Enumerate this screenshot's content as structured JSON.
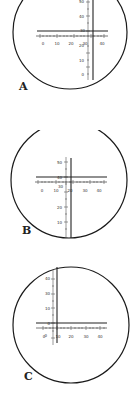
{
  "figure": {
    "panels": [
      {
        "label": "A",
        "top": -8,
        "circle": {
          "cx": 70,
          "cy": 36,
          "r": 56
        },
        "h_scale": {
          "y": 40,
          "x0": 36,
          "x1": 107,
          "ticks": [
            "0",
            "10",
            "20",
            "30",
            "40"
          ],
          "tick_y": 44,
          "label_y": 52
        },
        "v_scale": {
          "x": 88,
          "y0": 5,
          "y1": 86,
          "ticks": [
            "50",
            "40",
            "30",
            "20",
            "10"
          ]
        },
        "crosshair": {
          "h_y": 39,
          "h_x0": 37,
          "h_x1": 108,
          "v_x": 93,
          "v_y0": 0,
          "v_y1": 80
        }
      },
      {
        "label": "B",
        "top": 130,
        "circle": {
          "cx": 70,
          "cy": 57,
          "r": 57
        },
        "h_scale": {
          "y": 52,
          "x0": 36,
          "x1": 107,
          "ticks": [
            "0",
            "10",
            "20",
            "30",
            "40"
          ],
          "tick_y": 56,
          "label_y": 64
        },
        "v_scale": {
          "x": 67,
          "y0": 27,
          "y1": 108,
          "ticks": [
            "50",
            "40",
            "30",
            "20",
            "10"
          ]
        },
        "crosshair": {
          "h_y": 47,
          "h_x0": 36,
          "h_x1": 107,
          "v_x": 71,
          "v_y0": 28,
          "v_y1": 108
        }
      },
      {
        "label": "C",
        "top": 265,
        "circle": {
          "cx": 71,
          "cy": 60,
          "r": 57
        },
        "h_scale": {
          "y": 63,
          "x0": 36,
          "x1": 107,
          "ticks": [
            "0",
            "10",
            "20",
            "30",
            "40"
          ],
          "tick_y": 67,
          "label_y": 75
        },
        "v_scale": {
          "x": 53,
          "y0": 5,
          "y1": 80,
          "ticks": [
            "40",
            "30",
            "20",
            "10",
            "0"
          ]
        },
        "crosshair": {
          "h_y": 58,
          "h_x0": 36,
          "h_x1": 107,
          "v_x": 57,
          "v_y0": 2,
          "v_y1": 78
        }
      }
    ]
  },
  "labels": {
    "a": "A",
    "b": "B",
    "c": "C"
  }
}
